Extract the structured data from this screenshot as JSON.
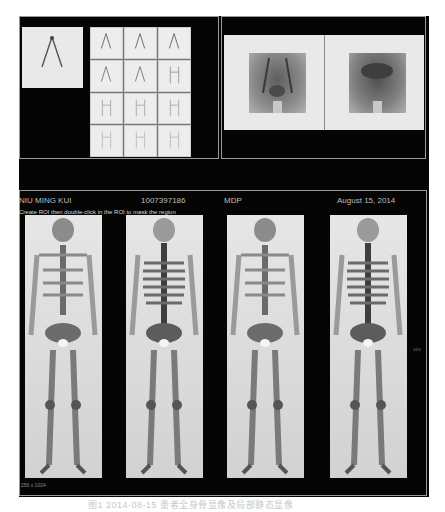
{
  "top_left_panel": {
    "header_labels": [
      "",
      "",
      "",
      ""
    ],
    "spot_view": {
      "icon": "dynamic-spot-image"
    },
    "frame_grid": {
      "rows": 4,
      "cols": 3,
      "frames": 12
    }
  },
  "top_right_panel": {
    "views": [
      "pelvis-anterior",
      "pelvis-posterior"
    ]
  },
  "bottom_panel": {
    "patient_name": "NIU MING KUI",
    "patient_id": "1007397186",
    "tracer": "MDP",
    "date": "August 15, 2014",
    "instruction": "Create ROI then double-click in the ROI to mask the region",
    "footer_label": "256 x 1024",
    "side_marker": "11%",
    "views": [
      "anterior-1",
      "posterior-1",
      "anterior-2",
      "posterior-2"
    ]
  },
  "caption": {
    "text": "图1  2014-08-15 患者全身骨显像及局部静态显像"
  },
  "colors": {
    "screen_bg": "#050505",
    "image_bg": "#e6e6e6",
    "text": "#bdbdbd"
  }
}
